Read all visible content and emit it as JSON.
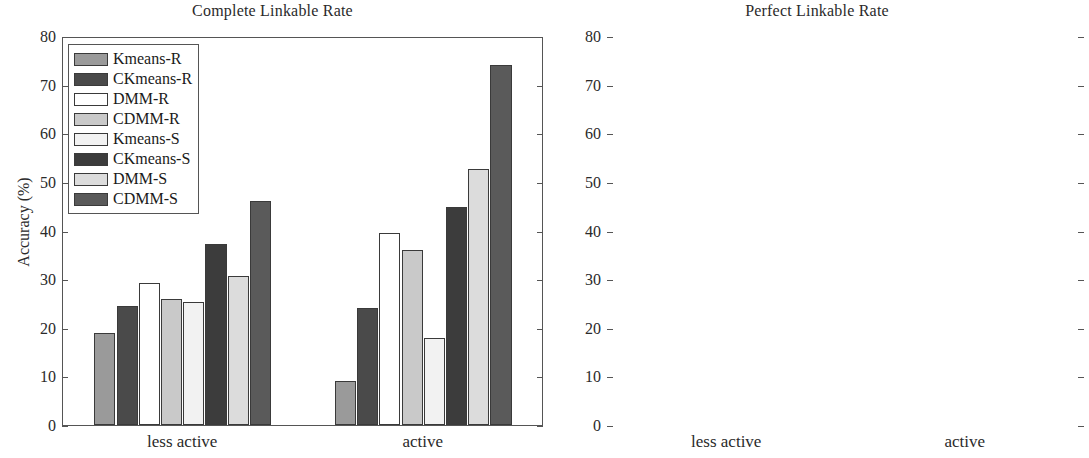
{
  "figure": {
    "width": 1089,
    "height": 458,
    "background": "#ffffff"
  },
  "series_colors": {
    "Kmeans-R": "#9a9a9a",
    "CKmeans-R": "#4a4a4a",
    "DMM-R": "#ffffff",
    "CDMM-R": "#c9c9c9",
    "Kmeans-S": "#f2f2f2",
    "CKmeans-S": "#3c3c3c",
    "DMM-S": "#dcdcdc",
    "CDMM-S": "#5a5a5a"
  },
  "axis": {
    "ylabel": "Accuracy (%)",
    "yticks": [
      0,
      10,
      20,
      30,
      40,
      50,
      60,
      70,
      80
    ],
    "ytick_labels": [
      "0",
      "10",
      "20",
      "30",
      "40",
      "50",
      "60",
      "70",
      "80"
    ],
    "ylim": [
      0,
      80
    ],
    "xtick_labels": [
      "less active",
      "active"
    ]
  },
  "legend": {
    "entries": [
      "Kmeans-R",
      "CKmeans-R",
      "DMM-R",
      "CDMM-R",
      "Kmeans-S",
      "CKmeans-S",
      "DMM-S",
      "CDMM-S"
    ],
    "position": "upper-left"
  },
  "panels": [
    {
      "id": "left",
      "title": "Complete Linkable Rate"
    },
    {
      "id": "right",
      "title": "Perfect Linkable Rate"
    }
  ],
  "chart_data": [
    {
      "type": "bar",
      "title": "Complete Linkable Rate",
      "xlabel": "",
      "ylabel": "Accuracy (%)",
      "ylim": [
        0,
        80
      ],
      "yticks": [
        0,
        10,
        20,
        30,
        40,
        50,
        60,
        70,
        80
      ],
      "grid": false,
      "legend_position": "upper-left",
      "categories": [
        "less active",
        "active"
      ],
      "series": [
        {
          "name": "Kmeans-R",
          "values": [
            19.0,
            9.0
          ]
        },
        {
          "name": "CKmeans-R",
          "values": [
            24.5,
            24.0
          ]
        },
        {
          "name": "DMM-R",
          "values": [
            29.3,
            39.5
          ]
        },
        {
          "name": "CDMM-R",
          "values": [
            26.0,
            36.0
          ]
        },
        {
          "name": "Kmeans-S",
          "values": [
            25.2,
            17.8
          ]
        },
        {
          "name": "CKmeans-S",
          "values": [
            37.2,
            44.8
          ]
        },
        {
          "name": "DMM-S",
          "values": [
            30.6,
            52.7
          ]
        },
        {
          "name": "CDMM-S",
          "values": [
            46.0,
            74.0
          ]
        }
      ]
    },
    {
      "type": "bar",
      "title": "Perfect Linkable Rate",
      "xlabel": "",
      "ylabel": "Accuracy (%)",
      "ylim": [
        0,
        80
      ],
      "yticks": [
        0,
        10,
        20,
        30,
        40,
        50,
        60,
        70,
        80
      ],
      "grid": false,
      "legend_position": "upper-left",
      "categories": [
        "less active",
        "active"
      ],
      "series": [
        {
          "name": "Kmeans-R",
          "values": [
            5.5,
            5.4
          ]
        },
        {
          "name": "CKmeans-R",
          "values": [
            6.0,
            15.0
          ]
        },
        {
          "name": "DMM-R",
          "values": [
            8.0,
            10.4
          ]
        },
        {
          "name": "CDMM-R",
          "values": [
            9.7,
            18.2
          ]
        },
        {
          "name": "Kmeans-S",
          "values": [
            13.3,
            12.3
          ]
        },
        {
          "name": "CKmeans-S",
          "values": [
            14.6,
            30.8
          ]
        },
        {
          "name": "DMM-S",
          "values": [
            15.6,
            26.2
          ]
        },
        {
          "name": "CDMM-S",
          "values": [
            17.5,
            48.3
          ]
        }
      ]
    }
  ]
}
